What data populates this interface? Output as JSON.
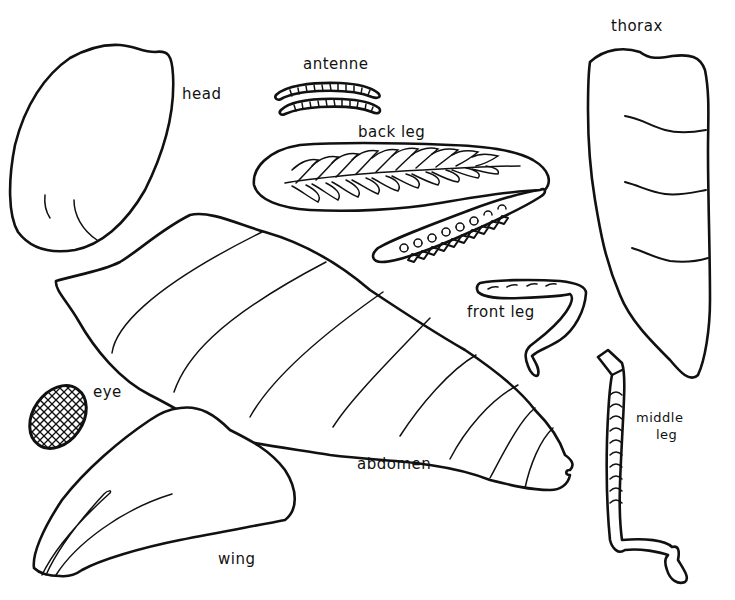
{
  "diagram": {
    "title_partial": "",
    "labels": {
      "head": "head",
      "antenne": "antenne",
      "back_leg": "back leg",
      "thorax": "thorax",
      "front_leg": "front leg",
      "eye": "eye",
      "abdomen": "abdomen",
      "middle_leg_line1": "middle",
      "middle_leg_line2": "leg",
      "wing": "wing"
    },
    "parts": [
      "head",
      "antenne",
      "back leg",
      "thorax",
      "front leg",
      "eye",
      "abdomen",
      "middle leg",
      "wing"
    ],
    "style": {
      "line_color": "#111111",
      "background": "#ffffff"
    }
  }
}
